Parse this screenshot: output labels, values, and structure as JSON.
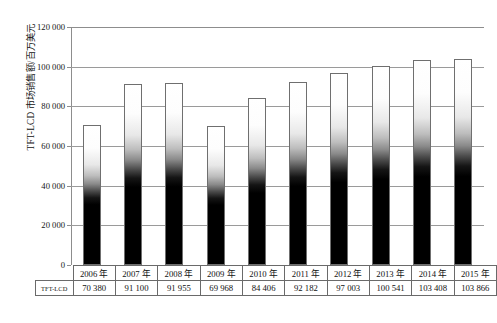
{
  "chart_data": {
    "type": "bar",
    "title": "",
    "xlabel": "",
    "ylabel": "TFT-LCD 市场销售额/百万美元",
    "ylim": [
      0,
      120000
    ],
    "ytick_labels": [
      "0",
      "20 000",
      "40 000",
      "60 000",
      "80 000",
      "100 000",
      "120 000"
    ],
    "ytick_values": [
      0,
      20000,
      40000,
      60000,
      80000,
      100000,
      120000
    ],
    "grid": true,
    "legend": "none",
    "categories": [
      "2006 年",
      "2007 年",
      "2008 年",
      "2009 年",
      "2010 年",
      "2011 年",
      "2012 年",
      "2013 年",
      "2014 年",
      "2015 年"
    ],
    "values": [
      70380,
      91100,
      91955,
      69968,
      84406,
      92182,
      97003,
      100541,
      103408,
      103866
    ],
    "value_labels": [
      "70 380",
      "91 100",
      "91 955",
      "69 968",
      "84 406",
      "92 182",
      "97 003",
      "100 541",
      "103 408",
      "103 866"
    ],
    "series": [
      {
        "name": "TFT-LCD",
        "values": [
          70380,
          91100,
          91955,
          69968,
          84406,
          92182,
          97003,
          100541,
          103408,
          103866
        ]
      }
    ]
  },
  "table": {
    "row_label": "TFT-LCD",
    "header_corner": "",
    "years": [
      "2006 年",
      "2007 年",
      "2008 年",
      "2009 年",
      "2010 年",
      "2011 年",
      "2012 年",
      "2013 年",
      "2014 年",
      "2015 年"
    ],
    "values": [
      "70 380",
      "91 100",
      "91 955",
      "69 968",
      "84 406",
      "92 182",
      "97 003",
      "100 541",
      "103 408",
      "103 866"
    ]
  },
  "caption": {
    "text": ""
  },
  "colors": {
    "axis": "#8d8d8d",
    "gridline": "#9a9a9a",
    "bar_top": "#ffffff",
    "bar_bottom": "#000000",
    "bar_outline": "#6f6f6f",
    "table_border": "#6a6a6a",
    "text": "#111111"
  }
}
